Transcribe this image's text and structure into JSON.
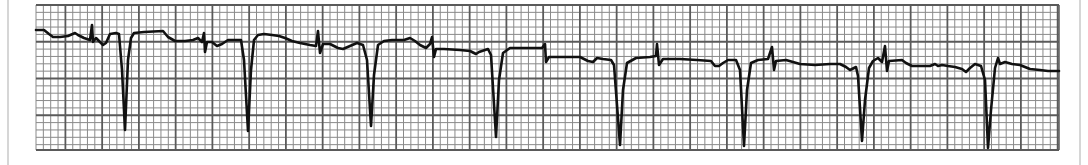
{
  "chart_data": {
    "type": "line",
    "title": "",
    "subtitle": "",
    "xlabel": "",
    "ylabel": "",
    "grid": true,
    "legend": null,
    "grid_box": {
      "x0": 36,
      "y0": 5,
      "x1": 1059,
      "y1": 150
    },
    "grid_spacing": {
      "small_px": 7.35,
      "large_px": 36.75
    },
    "colors": {
      "trace": "#111111",
      "grid_minor": "#8a8a8a",
      "grid_major": "#5a5a5a",
      "paper": "#ffffff"
    },
    "qrs_complex_x": [
      125,
      248,
      371,
      496,
      620,
      744,
      862,
      988
    ],
    "qrs_trough_y": [
      130,
      131,
      126,
      137,
      145,
      146,
      141,
      148
    ],
    "spike_x": [
      92,
      205,
      318,
      432,
      545,
      660,
      772,
      885
    ],
    "series": [
      {
        "name": "ECG lead",
        "points": [
          [
            36,
            30
          ],
          [
            44,
            30
          ],
          [
            49,
            34
          ],
          [
            53,
            37
          ],
          [
            60,
            37
          ],
          [
            68,
            36
          ],
          [
            75,
            33
          ],
          [
            78,
            35
          ],
          [
            84,
            38
          ],
          [
            90,
            40
          ],
          [
            92,
            25
          ],
          [
            93,
            42
          ],
          [
            96,
            38
          ],
          [
            100,
            42
          ],
          [
            103,
            45
          ],
          [
            106,
            43
          ],
          [
            110,
            34
          ],
          [
            116,
            33
          ],
          [
            119,
            34
          ],
          [
            122,
            70
          ],
          [
            125,
            130
          ],
          [
            128,
            60
          ],
          [
            131,
            38
          ],
          [
            134,
            33
          ],
          [
            144,
            32
          ],
          [
            163,
            31
          ],
          [
            168,
            37
          ],
          [
            175,
            41
          ],
          [
            185,
            41
          ],
          [
            193,
            40
          ],
          [
            198,
            38
          ],
          [
            202,
            42
          ],
          [
            204,
            33
          ],
          [
            205,
            52
          ],
          [
            207,
            42
          ],
          [
            212,
            42
          ],
          [
            217,
            46
          ],
          [
            222,
            44
          ],
          [
            228,
            40
          ],
          [
            241,
            40
          ],
          [
            244,
            60
          ],
          [
            248,
            131
          ],
          [
            251,
            70
          ],
          [
            254,
            40
          ],
          [
            258,
            35
          ],
          [
            264,
            34
          ],
          [
            272,
            35
          ],
          [
            279,
            36
          ],
          [
            285,
            38
          ],
          [
            292,
            41
          ],
          [
            300,
            43
          ],
          [
            310,
            45
          ],
          [
            316,
            46
          ],
          [
            318,
            31
          ],
          [
            320,
            53
          ],
          [
            323,
            44
          ],
          [
            330,
            44
          ],
          [
            338,
            48
          ],
          [
            343,
            49
          ],
          [
            350,
            46
          ],
          [
            357,
            43
          ],
          [
            363,
            45
          ],
          [
            367,
            60
          ],
          [
            371,
            126
          ],
          [
            374,
            75
          ],
          [
            378,
            45
          ],
          [
            384,
            41
          ],
          [
            392,
            40
          ],
          [
            404,
            40
          ],
          [
            410,
            38
          ],
          [
            415,
            41
          ],
          [
            420,
            45
          ],
          [
            426,
            48
          ],
          [
            430,
            44
          ],
          [
            432,
            37
          ],
          [
            434,
            57
          ],
          [
            436,
            49
          ],
          [
            444,
            49
          ],
          [
            460,
            50
          ],
          [
            470,
            51
          ],
          [
            476,
            54
          ],
          [
            479,
            52
          ],
          [
            482,
            51
          ],
          [
            488,
            49
          ],
          [
            491,
            55
          ],
          [
            496,
            137
          ],
          [
            499,
            80
          ],
          [
            503,
            53
          ],
          [
            510,
            48
          ],
          [
            522,
            48
          ],
          [
            534,
            48
          ],
          [
            542,
            48
          ],
          [
            545,
            44
          ],
          [
            546,
            62
          ],
          [
            549,
            57
          ],
          [
            560,
            57
          ],
          [
            580,
            57
          ],
          [
            588,
            61
          ],
          [
            593,
            62
          ],
          [
            597,
            58
          ],
          [
            603,
            59
          ],
          [
            611,
            60
          ],
          [
            614,
            65
          ],
          [
            620,
            145
          ],
          [
            623,
            90
          ],
          [
            627,
            63
          ],
          [
            636,
            58
          ],
          [
            650,
            57
          ],
          [
            656,
            56
          ],
          [
            657,
            44
          ],
          [
            659,
            65
          ],
          [
            663,
            59
          ],
          [
            680,
            59
          ],
          [
            697,
            60
          ],
          [
            711,
            61
          ],
          [
            715,
            66
          ],
          [
            719,
            66
          ],
          [
            723,
            63
          ],
          [
            728,
            60
          ],
          [
            736,
            60
          ],
          [
            740,
            70
          ],
          [
            744,
            146
          ],
          [
            747,
            90
          ],
          [
            751,
            63
          ],
          [
            758,
            60
          ],
          [
            768,
            59
          ],
          [
            772,
            47
          ],
          [
            774,
            70
          ],
          [
            776,
            61
          ],
          [
            786,
            60
          ],
          [
            800,
            64
          ],
          [
            815,
            65
          ],
          [
            830,
            64
          ],
          [
            840,
            64
          ],
          [
            846,
            67
          ],
          [
            850,
            70
          ],
          [
            856,
            67
          ],
          [
            858,
            76
          ],
          [
            862,
            141
          ],
          [
            865,
            100
          ],
          [
            869,
            68
          ],
          [
            873,
            61
          ],
          [
            878,
            58
          ],
          [
            882,
            62
          ],
          [
            885,
            46
          ],
          [
            887,
            71
          ],
          [
            889,
            61
          ],
          [
            902,
            60
          ],
          [
            906,
            63
          ],
          [
            912,
            66
          ],
          [
            920,
            66
          ],
          [
            930,
            66
          ],
          [
            935,
            64
          ],
          [
            938,
            66
          ],
          [
            942,
            65
          ],
          [
            948,
            66
          ],
          [
            955,
            67
          ],
          [
            962,
            69
          ],
          [
            966,
            72
          ],
          [
            970,
            68
          ],
          [
            975,
            64
          ],
          [
            981,
            66
          ],
          [
            985,
            80
          ],
          [
            988,
            148
          ],
          [
            991,
            110
          ],
          [
            995,
            68
          ],
          [
            998,
            58
          ],
          [
            1000,
            64
          ],
          [
            1005,
            62
          ],
          [
            1012,
            64
          ],
          [
            1020,
            65
          ],
          [
            1030,
            69
          ],
          [
            1040,
            70
          ],
          [
            1048,
            71
          ],
          [
            1059,
            71
          ]
        ]
      }
    ]
  }
}
